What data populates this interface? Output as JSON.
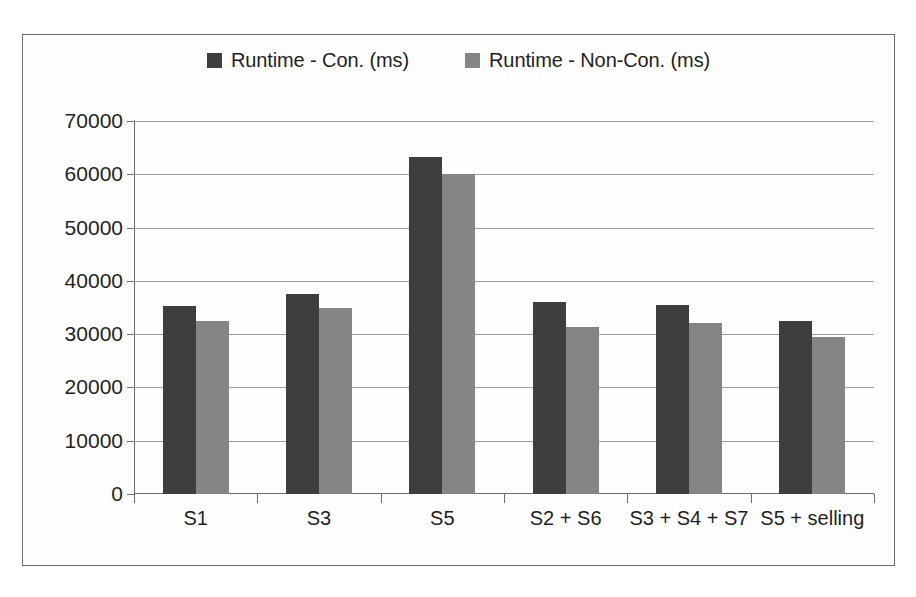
{
  "chart_data": {
    "type": "bar",
    "title": "",
    "subtitle": "",
    "xlabel": "",
    "ylabel": "",
    "ylim": [
      0,
      70000
    ],
    "ytick_labels": [
      "70000",
      "60000",
      "50000",
      "40000",
      "30000",
      "20000",
      "10000",
      "0"
    ],
    "ytick_values": [
      70000,
      60000,
      50000,
      40000,
      30000,
      20000,
      10000,
      0
    ],
    "grid": true,
    "legend_position": "top-center",
    "categories": [
      "S1",
      "S3",
      "S5",
      "S2 + S6",
      "S3 + S4 + S7",
      "S5 + selling"
    ],
    "series": [
      {
        "name": "Runtime - Con. (ms)",
        "color": "#3e3e3e",
        "values": [
          35200,
          37500,
          63200,
          36000,
          35400,
          32400
        ]
      },
      {
        "name": "Runtime - Non-Con. (ms)",
        "color": "#858585",
        "values": [
          32500,
          35000,
          60000,
          31300,
          32100,
          29500
        ]
      }
    ]
  },
  "legend": {
    "entries": [
      {
        "label": "Runtime - Con. (ms)",
        "swatch_color": "#3e3e3e",
        "swatch_icon": "legend-square-icon"
      },
      {
        "label": "Runtime - Non-Con. (ms)",
        "swatch_color": "#858585",
        "swatch_icon": "legend-square-icon"
      }
    ]
  }
}
